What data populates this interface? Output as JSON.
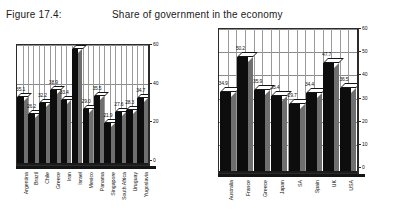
{
  "header": {
    "figure_label": "Figure 17.4:",
    "title": "Share of government in the economy"
  },
  "chart_data": [
    {
      "id": "developing-economies",
      "type": "bar",
      "title": "Share of government in the economy",
      "xlabel": "",
      "ylabel": "",
      "ylim": [
        0,
        60
      ],
      "yticks": [
        0,
        20,
        40,
        60
      ],
      "grid": true,
      "legend": "none",
      "categories": [
        "Argentina",
        "Brazil",
        "Chile",
        "Greece",
        "Iran",
        "Israel",
        "Mexico",
        "Panama",
        "Singapore",
        "South Africa",
        "Uruguay",
        "Yugoslavia"
      ],
      "values": [
        35.1,
        26.2,
        32.2,
        38.9,
        33.4,
        60,
        29.0,
        35.5,
        21.9,
        27.6,
        28.3,
        34.7
      ],
      "data_labels": [
        "35.1",
        "26.2",
        "32.2",
        "38.9",
        "33.4",
        "60",
        "29.0",
        "35.5",
        "21.9",
        "27.6",
        "28.3",
        "34.7"
      ]
    },
    {
      "id": "developed-economies",
      "type": "bar",
      "title": "Share of government in the economy",
      "xlabel": "",
      "ylabel": "",
      "ylim": [
        0,
        60
      ],
      "yticks": [
        0,
        10,
        20,
        30,
        40,
        50,
        60
      ],
      "grid": true,
      "legend": "none",
      "categories": [
        "Australia",
        "France",
        "Greece",
        "Japan",
        "SA",
        "Spain",
        "UK",
        "USA"
      ],
      "values": [
        34.9,
        50.2,
        35.9,
        33.4,
        29.7,
        34.4,
        47.7,
        36.5
      ],
      "data_labels": [
        "34.9",
        "50.2",
        "35.9",
        "33.4",
        "29.7",
        "34.4",
        "47.7",
        "36.5"
      ]
    }
  ],
  "colors": {
    "bar_face": "#0d0d0d",
    "bar_side": "#6f6f6f",
    "bar_top": "#ffffff",
    "grid": "#9a9a9a",
    "axis": "#2b2b2b",
    "text": "#111111",
    "background": "#ffffff"
  }
}
